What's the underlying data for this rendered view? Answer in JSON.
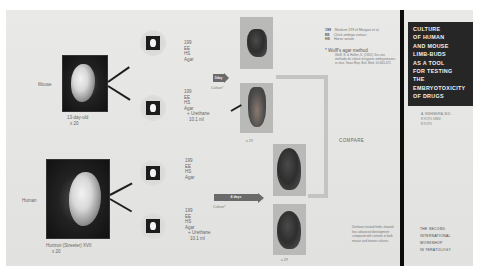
{
  "poster": {
    "title_lines": [
      "CULTURE",
      "OF HUMAN",
      "AND MOUSE",
      "LIMB-BUDS",
      "AS A TOOL",
      "FOR TESTING",
      "THE",
      "EMBRYOTOXICITY",
      "OF DRUGS"
    ],
    "author_lines": [
      "A. NISHIMURA, M.D.",
      "KYOTO UNIV.",
      "KYOTO"
    ],
    "footer_lines": [
      "THE SECOND",
      "INTERNATIONAL",
      "WORKSHOP",
      "IN TERATOLOGY"
    ]
  },
  "mouse": {
    "label": "Mouse",
    "caption_line1": "13-day-old",
    "caption_line2": "x 20",
    "upper_bud_media": [
      "199",
      "EE",
      "HS",
      "Agar"
    ],
    "lower_bud_media": [
      "199",
      "EE",
      "HS",
      "Agar",
      "+ Urethane",
      "10.1 ml"
    ],
    "culture_arrow_label": "3day",
    "culture_label": "Culture*",
    "limb_magnification": "x 29"
  },
  "human": {
    "label": "Human",
    "caption_line1": "Horizon (Streeter) XVII",
    "caption_line2": "x 20",
    "upper_bud_media": [
      "199",
      "EE",
      "HS",
      "Agar"
    ],
    "lower_bud_media": [
      "199",
      "EE",
      "HS",
      "Agar",
      "+ Urethane",
      "10.1 ml"
    ],
    "culture_arrow_label": "4 days",
    "culture_label": "Culture*",
    "limb_magnification": "x 29"
  },
  "legend": {
    "abbr": [
      {
        "key": "199",
        "desc": "Medium 199 of Morgan et al."
      },
      {
        "key": "EE",
        "desc": "Chick embryo extract"
      },
      {
        "key": "HS",
        "desc": "Horse serum"
      }
    ],
    "method_title": "* Wolff's agar method",
    "method_ref": "Wolff, E. & Haffen, K. (1952): Sur une methode de culture d'organes embryonnaires in vitro. Texas Rep. Biol. Med. 10:463-472."
  },
  "compare_label": "COMPARE",
  "notes_text": "Urethane treated limbs showed less advanced development compared with controls in both mouse and human cultures."
}
